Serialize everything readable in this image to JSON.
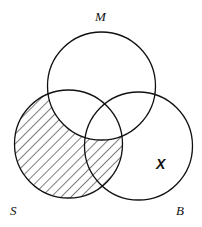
{
  "diagram": {
    "type": "venn-diagram",
    "circles": [
      {
        "id": "M",
        "label": "M",
        "cx": 101.5,
        "cy": 86,
        "r": 54
      },
      {
        "id": "S",
        "label": "S",
        "cx": 68.5,
        "cy": 144,
        "r": 54
      },
      {
        "id": "B",
        "label": "B",
        "cx": 138.5,
        "cy": 146,
        "r": 54
      }
    ],
    "labels": {
      "M": "M",
      "S": "S",
      "B": "B"
    },
    "shaded_region": "S minus M",
    "marker": {
      "text": "X",
      "region": "B only (not S, not M)"
    },
    "stroke_color": "#111111",
    "background": "#ffffff"
  }
}
